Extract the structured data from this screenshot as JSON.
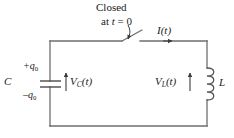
{
  "figure": {
    "stroke_color": "#4a4a4a",
    "text_color": "#1a1a1a",
    "background": "#ffffff"
  },
  "labels": {
    "switch_line1": "Closed",
    "switch_line2_prefix": "at ",
    "switch_line2_var": "t",
    "switch_line2_suffix": " = 0",
    "current": "I",
    "current_arg": "(t)",
    "capacitor_name": "C",
    "charge_positive_sign": "+q",
    "charge_positive_sub": "0",
    "charge_negative_sign": "–q",
    "charge_negative_sub": "0",
    "voltage_capacitor": "V",
    "voltage_capacitor_sub": "C",
    "voltage_capacitor_arg": "(t)",
    "voltage_inductor": "V",
    "voltage_inductor_sub": "L",
    "voltage_inductor_arg": "(t)",
    "inductor_name": "L"
  },
  "icons": {
    "switch": "open-switch-icon",
    "capacitor": "capacitor-plates-icon",
    "inductor": "inductor-coil-icon",
    "current_arrow": "current-direction-arrow-icon",
    "callout_arrow": "callout-curved-arrow-icon",
    "voltage_arrow_c": "voltage-up-arrow-icon",
    "voltage_arrow_l": "voltage-up-arrow-icon"
  }
}
